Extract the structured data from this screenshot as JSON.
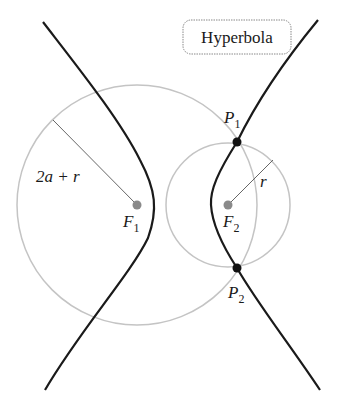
{
  "title": "Hyperbola",
  "labels": {
    "left_radius": "2a + r",
    "right_radius": "r",
    "focus1": "F",
    "focus1_sub": "1",
    "focus2": "F",
    "focus2_sub": "2",
    "point1": "P",
    "point1_sub": "1",
    "point2": "P",
    "point2_sub": "2"
  },
  "colors": {
    "hyperbola": "#1a1a1a",
    "circles": "#bdbdbd",
    "foci": "#8a8a8a",
    "points": "#111111",
    "radius_line": "#555555"
  }
}
